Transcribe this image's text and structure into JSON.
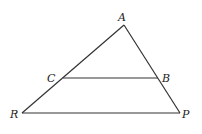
{
  "diagram": {
    "type": "triangle-with-parallel-segment",
    "colors": {
      "line": "#333333",
      "label": "#222222",
      "background": "#ffffff"
    },
    "points": {
      "A": {
        "label": "A",
        "x": 124,
        "y": 25
      },
      "B": {
        "label": "B",
        "x": 158,
        "y": 78
      },
      "C": {
        "label": "C",
        "x": 63,
        "y": 78
      },
      "R": {
        "label": "R",
        "x": 22,
        "y": 113
      },
      "P": {
        "label": "P",
        "x": 180,
        "y": 113
      }
    },
    "segments": [
      {
        "from": "A",
        "to": "R"
      },
      {
        "from": "A",
        "to": "P"
      },
      {
        "from": "R",
        "to": "P"
      },
      {
        "from": "C",
        "to": "B"
      }
    ]
  }
}
